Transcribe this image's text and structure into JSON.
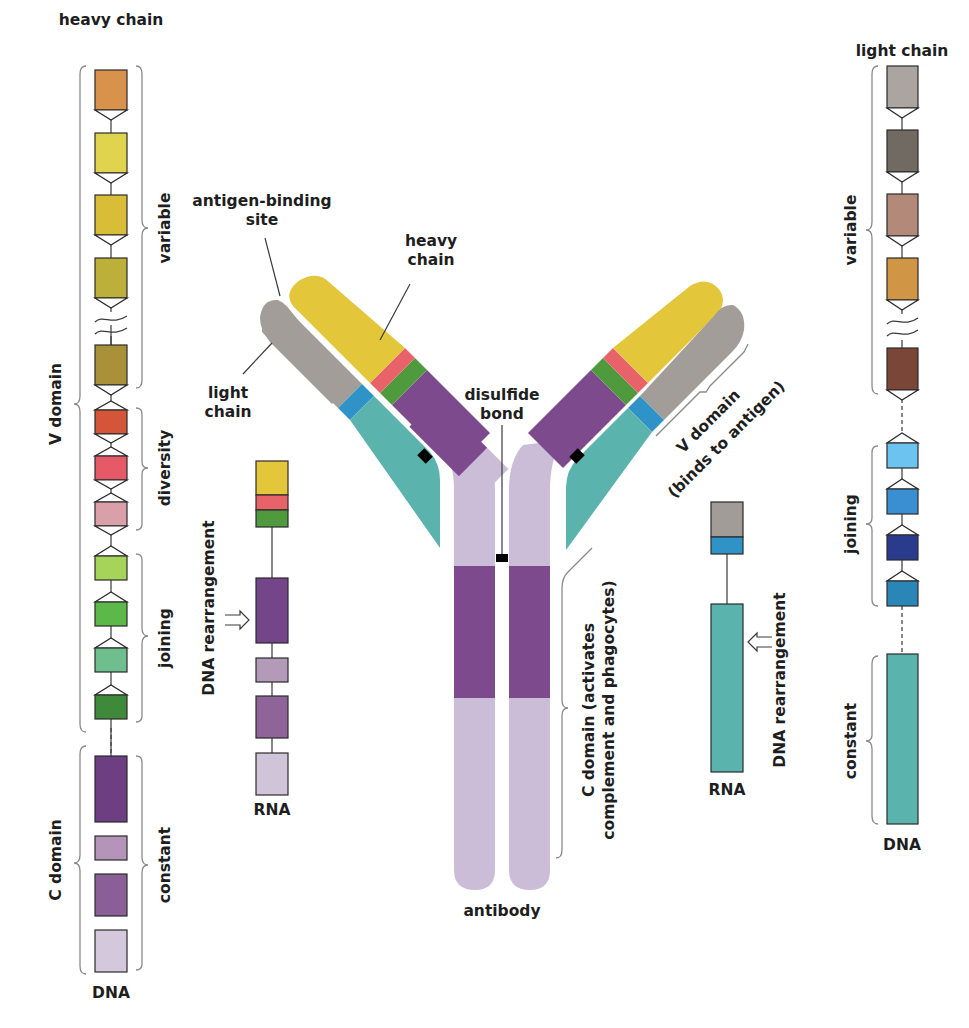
{
  "heavy_chain_dna": {
    "title": "heavy chain",
    "bottom_label": "DNA",
    "outer_braces": {
      "top": "V domain",
      "bottom": "C domain"
    },
    "inner_braces": {
      "variable": "variable",
      "diversity": "diversity",
      "joining": "joining",
      "constant": "constant"
    },
    "segments": {
      "variable": [
        "#d8924c",
        "#e0d34e",
        "#d9bd36",
        "#bdb03a",
        "#a9913a"
      ],
      "diversity": [
        "#d4553a",
        "#e65a68",
        "#d9a0aa"
      ],
      "joining": [
        "#a6d45a",
        "#5cb848",
        "#6fbf8e",
        "#3f8a3a"
      ],
      "constant": [
        "#6e3e82",
        "#b494b8",
        "#8a5f98",
        "#d4c8dc"
      ]
    }
  },
  "heavy_chain_rna": {
    "side_label": "DNA rearrangement",
    "bottom_label": "RNA",
    "segments": [
      "#e3c63a",
      "#e8626a",
      "#4f9a3c",
      "#744589",
      "#b39ab9",
      "#8e6499",
      "#d0c5d8"
    ]
  },
  "antibody": {
    "label": "antibody",
    "callouts": {
      "antigen_binding_site": "antigen-binding site",
      "heavy_chain": "heavy chain",
      "light_chain": "light chain",
      "disulfide_bond": "disulfide bond",
      "v_domain": "V domain",
      "v_domain_note": "(binds to antigen)",
      "c_domain": "C domain (activates",
      "c_domain_note": "complement and phagocytes)"
    },
    "colors": {
      "heavy_variable": "#e3c63a",
      "heavy_diversity": "#e8626a",
      "heavy_joining": "#4f9a3c",
      "heavy_constant_dark": "#7d4a8e",
      "heavy_constant_light": "#cbbdd7",
      "light_variable": "#a29d98",
      "light_joining": "#2f93c8",
      "light_constant": "#5bb3ad",
      "bond": "#000000"
    }
  },
  "light_chain_rna": {
    "side_label": "DNA rearrangement",
    "bottom_label": "RNA",
    "segments": [
      "#a19c97",
      "#2f93c8",
      "#5bb3ad"
    ]
  },
  "light_chain_dna": {
    "title": "light chain",
    "bottom_label": "DNA",
    "inner_braces": {
      "variable": "variable",
      "joining": "joining",
      "constant": "constant"
    },
    "segments": {
      "variable": [
        "#aaa5a1",
        "#706a62",
        "#b3897a",
        "#d09646",
        "#7a4638"
      ],
      "joining": [
        "#6cc3ef",
        "#3a8ed2",
        "#2a3a8c",
        "#2b86b8"
      ],
      "constant": [
        "#5bb3ad"
      ]
    }
  }
}
